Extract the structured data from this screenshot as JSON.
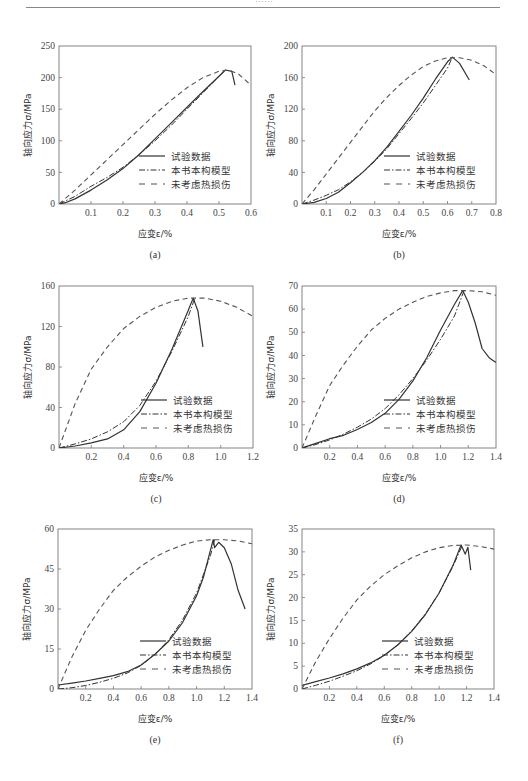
{
  "page": {
    "header_text": "……"
  },
  "legend": {
    "items": [
      {
        "label": "试验数据",
        "style": "solid"
      },
      {
        "label": "本书本构模型",
        "style": "dashdot"
      },
      {
        "label": "未考虑热损伤",
        "style": "dashed"
      }
    ]
  },
  "colors": {
    "line": "#333333",
    "dashed": "#555555",
    "axis": "#777777"
  },
  "chart_data": [
    {
      "panel": "(a)",
      "type": "line",
      "xlabel": "应变ε/%",
      "ylabel": "轴向应力σ/MPa",
      "xlim": [
        0,
        0.6
      ],
      "ylim": [
        0,
        250
      ],
      "xticks": [
        0.1,
        0.2,
        0.3,
        0.4,
        0.5,
        0.6
      ],
      "yticks": [
        0,
        50,
        100,
        150,
        200,
        250
      ],
      "box": {
        "x": 59,
        "y": 46,
        "w": 192,
        "h": 158
      },
      "series": [
        {
          "name": "试验数据",
          "x": [
            0,
            0.02,
            0.05,
            0.1,
            0.15,
            0.2,
            0.25,
            0.3,
            0.35,
            0.4,
            0.45,
            0.5,
            0.52,
            0.54,
            0.55
          ],
          "y": [
            0,
            2,
            8,
            22,
            38,
            56,
            78,
            103,
            128,
            153,
            178,
            202,
            212,
            210,
            188
          ]
        },
        {
          "name": "本书本构模型",
          "x": [
            0,
            0.05,
            0.1,
            0.15,
            0.2,
            0.25,
            0.3,
            0.35,
            0.4,
            0.45,
            0.5,
            0.52
          ],
          "y": [
            0,
            12,
            28,
            42,
            58,
            78,
            100,
            124,
            150,
            176,
            202,
            212
          ]
        },
        {
          "name": "未考虑热损伤",
          "x": [
            0,
            0.05,
            0.1,
            0.15,
            0.2,
            0.25,
            0.3,
            0.35,
            0.4,
            0.45,
            0.5,
            0.53,
            0.56,
            0.6
          ],
          "y": [
            0,
            22,
            46,
            70,
            94,
            118,
            142,
            164,
            184,
            200,
            210,
            212,
            206,
            188
          ]
        }
      ]
    },
    {
      "panel": "(b)",
      "type": "line",
      "xlabel": "应变ε/%",
      "ylabel": "轴向应力σ/MPa",
      "xlim": [
        0,
        0.8
      ],
      "ylim": [
        0,
        200
      ],
      "xticks": [
        0.1,
        0.2,
        0.3,
        0.4,
        0.5,
        0.6,
        0.7,
        0.8
      ],
      "yticks": [
        0,
        40,
        80,
        120,
        160,
        200
      ],
      "box": {
        "x": 302,
        "y": 46,
        "w": 194,
        "h": 158
      },
      "series": [
        {
          "name": "试验数据",
          "x": [
            0,
            0.05,
            0.1,
            0.15,
            0.2,
            0.25,
            0.3,
            0.35,
            0.4,
            0.45,
            0.5,
            0.55,
            0.6,
            0.62,
            0.65,
            0.69
          ],
          "y": [
            0,
            2,
            7,
            15,
            27,
            40,
            55,
            72,
            92,
            112,
            134,
            158,
            180,
            186,
            178,
            157
          ]
        },
        {
          "name": "本书本构模型",
          "x": [
            0,
            0.05,
            0.1,
            0.15,
            0.2,
            0.25,
            0.3,
            0.35,
            0.4,
            0.45,
            0.5,
            0.55,
            0.6,
            0.62
          ],
          "y": [
            0,
            5,
            11,
            18,
            28,
            40,
            54,
            70,
            89,
            108,
            128,
            150,
            172,
            186
          ]
        },
        {
          "name": "未考虑热损伤",
          "x": [
            0,
            0.05,
            0.1,
            0.15,
            0.2,
            0.25,
            0.3,
            0.35,
            0.4,
            0.45,
            0.5,
            0.55,
            0.6,
            0.65,
            0.7,
            0.75,
            0.8
          ],
          "y": [
            0,
            18,
            38,
            58,
            78,
            98,
            118,
            135,
            150,
            163,
            174,
            181,
            185,
            185,
            182,
            175,
            164
          ]
        }
      ]
    },
    {
      "panel": "(c)",
      "type": "line",
      "xlabel": "应变ε/%",
      "ylabel": "轴向应力σ/MPa",
      "xlim": [
        0,
        1.2
      ],
      "ylim": [
        0,
        160
      ],
      "xticks": [
        0.2,
        0.4,
        0.6,
        0.8,
        1.0,
        1.2
      ],
      "yticks": [
        0,
        40,
        80,
        120,
        160
      ],
      "box": {
        "x": 59,
        "y": 286,
        "w": 194,
        "h": 162
      },
      "series": [
        {
          "name": "试验数据",
          "x": [
            0,
            0.1,
            0.2,
            0.3,
            0.4,
            0.5,
            0.6,
            0.7,
            0.8,
            0.83,
            0.86,
            0.89
          ],
          "y": [
            0,
            2,
            5,
            9,
            18,
            36,
            64,
            98,
            136,
            148,
            135,
            100
          ]
        },
        {
          "name": "本书本构模型",
          "x": [
            0,
            0.1,
            0.2,
            0.3,
            0.4,
            0.5,
            0.6,
            0.7,
            0.8,
            0.84
          ],
          "y": [
            0,
            4,
            9,
            16,
            26,
            42,
            66,
            96,
            130,
            148
          ]
        },
        {
          "name": "未考虑热损伤",
          "x": [
            0,
            0.05,
            0.1,
            0.2,
            0.3,
            0.4,
            0.5,
            0.6,
            0.7,
            0.8,
            0.9,
            1.0,
            1.1,
            1.2
          ],
          "y": [
            0,
            22,
            44,
            78,
            100,
            118,
            130,
            139,
            145,
            148,
            148,
            145,
            139,
            130
          ]
        }
      ]
    },
    {
      "panel": "(d)",
      "type": "line",
      "xlabel": "应变ε/%",
      "ylabel": "轴向应力σ/MPa",
      "xlim": [
        0,
        1.4
      ],
      "ylim": [
        0,
        70
      ],
      "xticks": [
        0.2,
        0.4,
        0.6,
        0.8,
        1.0,
        1.2,
        1.4
      ],
      "yticks": [
        0,
        10,
        20,
        30,
        40,
        50,
        60,
        70
      ],
      "box": {
        "x": 302,
        "y": 286,
        "w": 194,
        "h": 162
      },
      "series": [
        {
          "name": "试验数据",
          "x": [
            0,
            0.1,
            0.2,
            0.3,
            0.4,
            0.5,
            0.6,
            0.7,
            0.8,
            0.9,
            1.0,
            1.1,
            1.16,
            1.2,
            1.25,
            1.3,
            1.35,
            1.4
          ],
          "y": [
            0,
            2,
            4,
            5.5,
            8,
            11,
            15,
            21,
            29,
            39,
            51,
            62,
            68,
            63,
            54,
            43,
            39,
            37
          ]
        },
        {
          "name": "本书本构模型",
          "x": [
            0,
            0.1,
            0.2,
            0.3,
            0.4,
            0.5,
            0.6,
            0.7,
            0.8,
            0.9,
            1.0,
            1.1,
            1.17
          ],
          "y": [
            0,
            1.5,
            3.5,
            6,
            9,
            12.5,
            17,
            23,
            30,
            38,
            47,
            57,
            68
          ]
        },
        {
          "name": "未考虑热损伤",
          "x": [
            0,
            0.1,
            0.2,
            0.3,
            0.4,
            0.5,
            0.6,
            0.7,
            0.8,
            0.9,
            1.0,
            1.1,
            1.2,
            1.3,
            1.4
          ],
          "y": [
            0,
            14,
            27,
            36,
            44,
            51,
            56,
            60,
            63,
            65.5,
            67,
            68,
            68,
            67.5,
            66
          ]
        }
      ]
    },
    {
      "panel": "(e)",
      "type": "line",
      "xlabel": "应变ε/%",
      "ylabel": "轴向应力σ/MPa",
      "xlim": [
        0,
        1.4
      ],
      "ylim": [
        0,
        60
      ],
      "xticks": [
        0.2,
        0.4,
        0.6,
        0.8,
        1.0,
        1.2,
        1.4
      ],
      "yticks": [
        0,
        15,
        30,
        45,
        60
      ],
      "box": {
        "x": 58,
        "y": 529,
        "w": 194,
        "h": 160
      },
      "series": [
        {
          "name": "试验数据",
          "x": [
            0,
            0.1,
            0.2,
            0.3,
            0.4,
            0.5,
            0.6,
            0.7,
            0.8,
            0.9,
            1.0,
            1.05,
            1.1,
            1.12,
            1.13,
            1.16,
            1.2,
            1.25,
            1.3,
            1.35
          ],
          "y": [
            1.5,
            2.2,
            3,
            4,
            5,
            6.5,
            9,
            13,
            18,
            25,
            35,
            42,
            52,
            56,
            53,
            55,
            53,
            47,
            37,
            30
          ]
        },
        {
          "name": "本书本构模型",
          "x": [
            0,
            0.1,
            0.2,
            0.3,
            0.4,
            0.5,
            0.6,
            0.7,
            0.8,
            0.9,
            1.0,
            1.05,
            1.1,
            1.13
          ],
          "y": [
            0,
            0.5,
            1.3,
            2.5,
            4,
            6,
            8.8,
            13,
            18.5,
            26,
            36,
            43,
            50,
            56
          ]
        },
        {
          "name": "未考虑热损伤",
          "x": [
            0,
            0.05,
            0.1,
            0.2,
            0.3,
            0.4,
            0.5,
            0.6,
            0.7,
            0.8,
            0.9,
            1.0,
            1.1,
            1.2,
            1.3,
            1.4
          ],
          "y": [
            0,
            6,
            12,
            22,
            30,
            37,
            42,
            46,
            49.5,
            52,
            54,
            55.5,
            56,
            56,
            55.5,
            54.5
          ]
        }
      ]
    },
    {
      "panel": "(f)",
      "type": "line",
      "xlabel": "应变ε/%",
      "ylabel": "轴向应力σ/MPa",
      "xlim": [
        0,
        1.4
      ],
      "ylim": [
        0,
        35
      ],
      "xticks": [
        0.2,
        0.4,
        0.6,
        0.8,
        1.0,
        1.2,
        1.4
      ],
      "yticks": [
        0,
        5,
        10,
        15,
        20,
        25,
        30,
        35
      ],
      "box": {
        "x": 302,
        "y": 529,
        "w": 192,
        "h": 160
      },
      "series": [
        {
          "name": "试验数据",
          "x": [
            0,
            0.1,
            0.2,
            0.3,
            0.4,
            0.5,
            0.6,
            0.7,
            0.8,
            0.9,
            1.0,
            1.1,
            1.16,
            1.19,
            1.21,
            1.23
          ],
          "y": [
            0.8,
            1.6,
            2.4,
            3.3,
            4.4,
            5.7,
            7.4,
            9.7,
            12.6,
            16.3,
            21,
            27,
            31.5,
            29.5,
            31,
            26
          ]
        },
        {
          "name": "本书本构模型",
          "x": [
            0,
            0.1,
            0.2,
            0.3,
            0.4,
            0.5,
            0.6,
            0.7,
            0.8,
            0.9,
            1.0,
            1.1,
            1.17
          ],
          "y": [
            0,
            0.8,
            1.7,
            2.8,
            4,
            5.5,
            7.3,
            9.7,
            12.7,
            16.4,
            21,
            26.8,
            31.5
          ]
        },
        {
          "name": "未考虑热损伤",
          "x": [
            0,
            0.1,
            0.2,
            0.3,
            0.4,
            0.5,
            0.6,
            0.7,
            0.8,
            0.9,
            1.0,
            1.1,
            1.2,
            1.3,
            1.4
          ],
          "y": [
            0,
            6,
            11,
            15.5,
            19.5,
            22.5,
            25,
            27,
            28.7,
            30,
            30.9,
            31.4,
            31.5,
            31.2,
            30.6
          ]
        }
      ]
    }
  ]
}
